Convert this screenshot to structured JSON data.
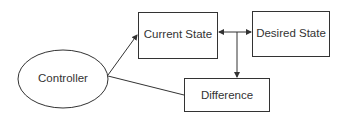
{
  "diagram": {
    "nodes": [
      {
        "id": "controller",
        "label": "Controller",
        "shape": "ellipse"
      },
      {
        "id": "current_state",
        "label": "Current State",
        "shape": "rectangle"
      },
      {
        "id": "desired_state",
        "label": "Desired State",
        "shape": "rectangle"
      },
      {
        "id": "difference",
        "label": "Difference",
        "shape": "rectangle"
      }
    ],
    "edges": [
      {
        "from": "controller",
        "to": "current_state",
        "arrow": "end"
      },
      {
        "from": "controller",
        "to": "difference",
        "arrow": "none"
      },
      {
        "from": "junction",
        "to": "current_state",
        "arrow": "end"
      },
      {
        "from": "junction",
        "to": "desired_state",
        "arrow": "end"
      },
      {
        "from": "junction",
        "to": "difference",
        "arrow": "end"
      }
    ],
    "colors": {
      "stroke": "#333333",
      "text": "#333333",
      "background": "#ffffff"
    }
  }
}
